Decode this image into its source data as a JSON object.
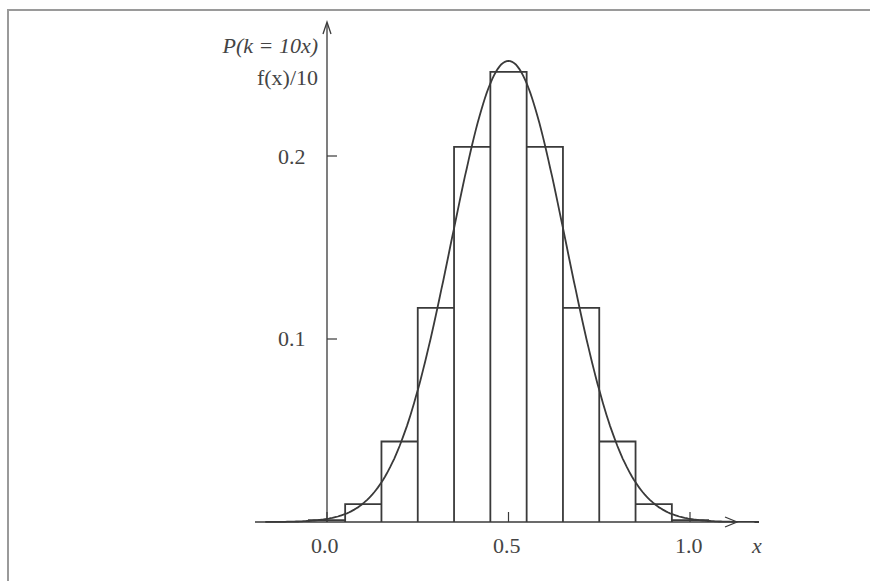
{
  "chart_data": {
    "type": "bar",
    "subtype": "step-histogram-with-curve",
    "title": "",
    "ylabel_line1": "P(k = 10x)",
    "ylabel_line2": "f(x)/10",
    "xlabel": "x",
    "x_ticks": [
      "0.0",
      "0.5",
      "1.0"
    ],
    "x_tick_values": [
      0.0,
      0.5,
      1.0
    ],
    "y_ticks": [
      "0.1",
      "0.2"
    ],
    "y_tick_values": [
      0.1,
      0.2
    ],
    "xlim": [
      -0.17,
      1.26
    ],
    "ylim": [
      0,
      0.26
    ],
    "grid": false,
    "legend": null,
    "categories": [
      "0.0",
      "0.1",
      "0.2",
      "0.3",
      "0.4",
      "0.5",
      "0.6",
      "0.7",
      "0.8",
      "0.9",
      "1.0"
    ],
    "series": [
      {
        "name": "P(k = 10x) (binomial n=10, p=0.5, step)",
        "x": [
          0.0,
          0.1,
          0.2,
          0.3,
          0.4,
          0.5,
          0.6,
          0.7,
          0.8,
          0.9,
          1.0
        ],
        "values": [
          0.001,
          0.0098,
          0.044,
          0.117,
          0.205,
          0.246,
          0.205,
          0.117,
          0.044,
          0.0098,
          0.001
        ]
      },
      {
        "name": "f(x)/10 (normal density, mean 0.5, sd ~0.158)",
        "type": "line",
        "mean": 0.5,
        "sd": 0.158,
        "peak": 0.252
      }
    ]
  },
  "axis": {
    "y_label_line1": "P(k = 10x)",
    "y_label_line2": "f(x)/10",
    "x_label": "x",
    "ticks_x": [
      "0.0",
      "0.5",
      "1.0"
    ],
    "ticks_y": [
      "0.2",
      "0.1"
    ]
  }
}
